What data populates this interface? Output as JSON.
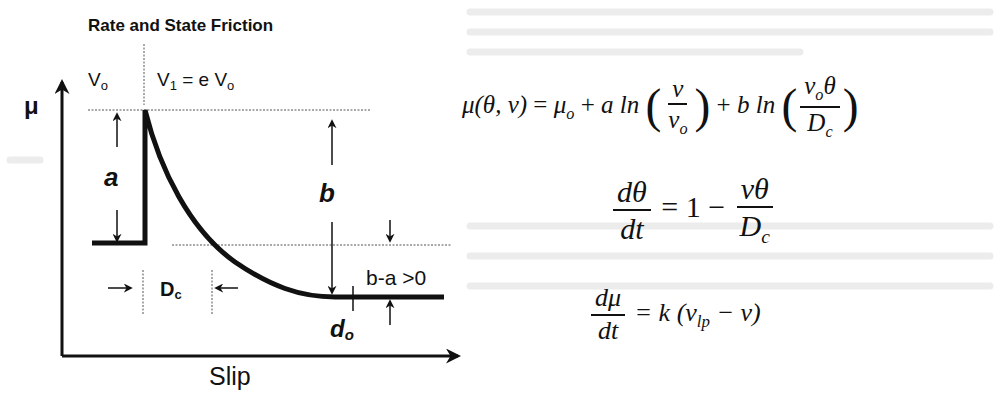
{
  "diagram": {
    "title": "Rate and State Friction",
    "y_axis_label": "μ",
    "x_axis_label": "Slip",
    "labels": {
      "v0": "V",
      "v0_sub": "o",
      "v1": "V",
      "v1_sub": "1",
      "v1_rhs": " = e V",
      "v1_rhs_sub": "o",
      "a": "a",
      "b": "b",
      "dc": "D",
      "dc_sub": "c",
      "b_minus_a": "b-a >0",
      "d0": "d",
      "d0_sub": "o"
    },
    "colors": {
      "ink": "#111111",
      "dotted": "#555555",
      "ghost": "#e6e6e6"
    }
  },
  "equations": {
    "eq1": {
      "lhs": "μ(θ, v)",
      "eq": " = ",
      "mu0": "μ",
      "mu0_sub": "o",
      "plus1": " + ",
      "a_ln": "a ln",
      "f1_num": "v",
      "f1_den": "v",
      "f1_den_sub": "o",
      "plus2": " + ",
      "b_ln": "b ln",
      "f2_num": "v",
      "f2_num_sub": "o",
      "f2_num_rest": "θ",
      "f2_den": "D",
      "f2_den_sub": "c"
    },
    "eq2": {
      "lhs_num": "dθ",
      "lhs_den": "dt",
      "rhs": " = 1 − ",
      "f_num": "vθ",
      "f_den": "D",
      "f_den_sub": "c"
    },
    "eq3": {
      "lhs_num": "dμ",
      "lhs_den": "dt",
      "rhs": " = k (v",
      "rhs_sub": "lp",
      "rhs_end": " − v)"
    }
  }
}
